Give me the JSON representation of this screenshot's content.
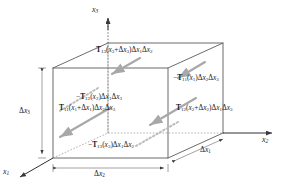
{
  "figure": {
    "type": "stress-cube-diagram",
    "colors": {
      "edge": "#6b6b6b",
      "hidden_edge": "#9a9a9a",
      "arrow": "#a8a8a8",
      "text": "#1a1a1a",
      "background": "#ffffff"
    }
  },
  "axes": [
    {
      "name": "x3-axis-label",
      "label": "x",
      "sub": "3",
      "direction": "up"
    },
    {
      "name": "x2-axis-label",
      "label": "x",
      "sub": "2",
      "direction": "right"
    },
    {
      "name": "x1-axis-label",
      "label": "x",
      "sub": "1",
      "direction": "down-left"
    }
  ],
  "dimensions": [
    {
      "name": "delta-x3",
      "text": "Δx",
      "sub": "3",
      "edge": "left-vertical"
    },
    {
      "name": "delta-x2",
      "text": "Δx",
      "sub": "2",
      "edge": "bottom-front"
    },
    {
      "name": "delta-x1",
      "text": "Δx",
      "sub": "1",
      "edge": "bottom-right-receding"
    }
  ],
  "stress_labels": [
    {
      "name": "stress-top-face",
      "face": "top",
      "sign": "",
      "tensor": "T",
      "indices": "13",
      "argument": "(x₃+Δx₃)",
      "area": "Δx₁Δx₂",
      "html": "<b>T</b><sub>13</sub>(<i>x</i><sub>3</sub>+Δ<i>x</i><sub>3</sub>)Δ<i>x</i><sub>1</sub>Δ<i>x</i><sub>2</sub>"
    },
    {
      "name": "stress-back-right-face",
      "face": "back-x1",
      "sign": "−",
      "tensor": "T",
      "indices": "11",
      "argument": "(x₁)",
      "area": "Δx₂Δx₃",
      "html": "−<b>T</b><sub>11</sub>(<i>x</i><sub>1</sub>)Δ<i>x</i><sub>2</sub>Δ<i>x</i><sub>3</sub>"
    },
    {
      "name": "stress-left-face",
      "face": "left-x2",
      "sign": "−",
      "tensor": "T",
      "indices": "12",
      "argument": "(x₂)",
      "area": "Δx₁Δx₃",
      "html": "−<b>T</b><sub>12</sub>(<i>x</i><sub>2</sub>)Δ<i>x</i><sub>1</sub>Δ<i>x</i><sub>3</sub>"
    },
    {
      "name": "stress-front-face",
      "face": "front-x1",
      "sign": "",
      "tensor": "T",
      "indices": "11",
      "argument": "(x₁+Δx₁)",
      "area": "Δx₂Δx₃",
      "html": "<b>T</b><sub>11</sub>(<i>x</i><sub>1</sub>+Δ<i>x</i><sub>1</sub>)Δ<i>x</i><sub>2</sub>Δ<i>x</i><sub>3</sub>"
    },
    {
      "name": "stress-right-face",
      "face": "right-x2",
      "sign": "",
      "tensor": "T",
      "indices": "12",
      "argument": "(x₂+Δx₂)",
      "area": "Δx₁Δx₃",
      "html": "<b>T</b><sub>12</sub>(<i>x</i><sub>2</sub>+Δ<i>x</i><sub>2</sub>)Δ<i>x</i><sub>1</sub>Δ<i>x</i><sub>3</sub>"
    },
    {
      "name": "stress-bottom-face",
      "face": "bottom",
      "sign": "−",
      "tensor": "T",
      "indices": "13",
      "argument": "(x₃)",
      "area": "Δx₁Δx₂",
      "html": "−<b>T</b><sub>13</sub>(<i>x</i><sub>3</sub>)Δ<i>x</i><sub>1</sub>Δ<i>x</i><sub>2</sub>"
    }
  ]
}
